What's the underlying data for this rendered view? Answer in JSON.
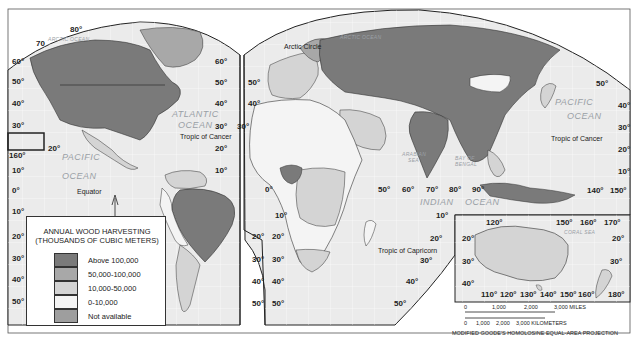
{
  "map": {
    "projection_label": "MODIFIED GOODE'S HOMOLOSINE EQUAL-AREA PROJECTION",
    "colors": {
      "above_100000": "#7a7a7a",
      "from_50000_to_100000": "#a8a8a8",
      "from_10000_to_50000": "#d4d4d4",
      "from_0_to_10000": "#f4f4f4",
      "not_available": "#9e9e9e",
      "ocean": "#ebebeb",
      "border": "#2b2b2b"
    }
  },
  "legend": {
    "title_line1": "ANNUAL WOOD HARVESTING",
    "title_line2": "(THOUSANDS OF CUBIC METERS)",
    "items": [
      {
        "label": "Above 100,000",
        "color": "#7a7a7a"
      },
      {
        "label": "50,000-100,000",
        "color": "#a8a8a8"
      },
      {
        "label": "10,000-50,000",
        "color": "#d4d4d4"
      },
      {
        "label": "0-10,000",
        "color": "#f4f4f4"
      },
      {
        "label": "Not available",
        "color": "#9e9e9e"
      }
    ]
  },
  "oceans": {
    "arctic_ocean_west": "ARCTIC OCEAN",
    "arctic_ocean_east": "ARCTIC OCEAN",
    "atlantic_ocean_1": "ATLANTIC",
    "atlantic_ocean_2": "OCEAN",
    "pacific_ocean_west_1": "PACIFIC",
    "pacific_ocean_west_2": "OCEAN",
    "pacific_ocean_east_1": "PACIFIC",
    "pacific_ocean_east_2": "OCEAN",
    "indian_ocean_1": "INDIAN",
    "indian_ocean_2": "OCEAN",
    "arabian_sea_1": "ARABIAN",
    "arabian_sea_2": "SEA",
    "bay_of_bengal_1": "BAY OF",
    "bay_of_bengal_2": "BENGAL",
    "coral_sea": "CORAL SEA"
  },
  "annotations": {
    "arctic_circle": "Arctic Circle",
    "tropic_of_cancer_west": "Tropic of Cancer",
    "tropic_of_cancer_east": "Tropic of Cancer",
    "equator": "Equator",
    "tropic_of_capricorn": "Tropic of Capricorn"
  },
  "graticule_labels": {
    "west_lat": [
      "60°",
      "50°",
      "40°",
      "30°",
      "20°",
      "10°",
      "0°",
      "10°",
      "20°",
      "30°",
      "40°",
      "50°"
    ],
    "top_lon": [
      "80°",
      "70"
    ],
    "hawaii_lon": "160°",
    "pacific_20": "20°",
    "americas_gore_lat_north": [
      "60°",
      "50°",
      "40°",
      "30°",
      "20°",
      "10°"
    ],
    "americas_gore_lat_south": [
      "20°",
      "30°",
      "40°",
      "50°"
    ],
    "europe_gore_lat_north": [
      "50°",
      "40°",
      "30°"
    ],
    "africa_gore_lat_south": [
      "20°",
      "30°",
      "40°",
      "50°"
    ],
    "africa_equator": "0°",
    "africa_10s": "10°",
    "indian_lon": [
      "50°",
      "60°",
      "70°",
      "80°",
      "90°"
    ],
    "indian_lat_south": [
      "10°",
      "20°",
      "30°",
      "40°",
      "50°"
    ],
    "east_lat": [
      "50°",
      "40°",
      "30°",
      "20°",
      "10°"
    ],
    "east_lon": [
      "140°",
      "150°"
    ]
  },
  "australia_inset": {
    "top_lon": [
      "120°",
      "150°",
      "160°",
      "170°"
    ],
    "left_lat": [
      "20°",
      "30°",
      "40°"
    ],
    "right_lat": [
      "20°",
      "30°"
    ],
    "bottom_lon": [
      "110°",
      "120°",
      "130°",
      "140°",
      "150°",
      "160°",
      "180°"
    ]
  },
  "scale_bar": {
    "miles_ticks": [
      "0",
      "1,000",
      "2,000",
      "3,000 MILES"
    ],
    "km_ticks": [
      "0",
      "1,000",
      "2,000",
      "3,000 KILOMETERS"
    ]
  }
}
